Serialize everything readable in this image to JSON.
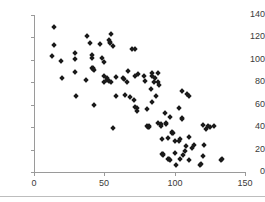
{
  "chart_data": {
    "type": "scatter",
    "title": "",
    "xlabel": "",
    "ylabel": "",
    "xlim": [
      0,
      150
    ],
    "ylim": [
      0,
      140
    ],
    "xticks": [
      0,
      50,
      100,
      150
    ],
    "yticks": [
      0,
      20,
      40,
      60,
      80,
      100,
      120,
      140
    ],
    "grid": false,
    "legend": null,
    "marker": "diamond",
    "marker_color": "#1a1a1a",
    "axis_color": "#9a9a9a",
    "n_points": 110,
    "points": [
      [
        14,
        129
      ],
      [
        13,
        103
      ],
      [
        14,
        113
      ],
      [
        19,
        99
      ],
      [
        20,
        84
      ],
      [
        29,
        106
      ],
      [
        29,
        101
      ],
      [
        29,
        89
      ],
      [
        30,
        68
      ],
      [
        38,
        121
      ],
      [
        37,
        82
      ],
      [
        40,
        115
      ],
      [
        41,
        104
      ],
      [
        41,
        102
      ],
      [
        41,
        93
      ],
      [
        42,
        93
      ],
      [
        42,
        92
      ],
      [
        43,
        91
      ],
      [
        43,
        60
      ],
      [
        47,
        114
      ],
      [
        48,
        102
      ],
      [
        50,
        98
      ],
      [
        50,
        86
      ],
      [
        50,
        80
      ],
      [
        52,
        84
      ],
      [
        52,
        82
      ],
      [
        53,
        81
      ],
      [
        53,
        118
      ],
      [
        54,
        116
      ],
      [
        54,
        115
      ],
      [
        55,
        123
      ],
      [
        55,
        80
      ],
      [
        56,
        112
      ],
      [
        56,
        39
      ],
      [
        58,
        85
      ],
      [
        58,
        68
      ],
      [
        63,
        84
      ],
      [
        64,
        83
      ],
      [
        65,
        69
      ],
      [
        66,
        80
      ],
      [
        67,
        90
      ],
      [
        68,
        67
      ],
      [
        70,
        110
      ],
      [
        72,
        110
      ],
      [
        71,
        64
      ],
      [
        72,
        86
      ],
      [
        72,
        58
      ],
      [
        73,
        57
      ],
      [
        73,
        54
      ],
      [
        74,
        87
      ],
      [
        78,
        86
      ],
      [
        79,
        81
      ],
      [
        80,
        56
      ],
      [
        80,
        41
      ],
      [
        81,
        40
      ],
      [
        82,
        41
      ],
      [
        82,
        40
      ],
      [
        83,
        74
      ],
      [
        84,
        88
      ],
      [
        84,
        86
      ],
      [
        84,
        62
      ],
      [
        85,
        80
      ],
      [
        86,
        84
      ],
      [
        87,
        68
      ],
      [
        88,
        88
      ],
      [
        88,
        80
      ],
      [
        88,
        44
      ],
      [
        89,
        78
      ],
      [
        90,
        43
      ],
      [
        90,
        41
      ],
      [
        91,
        29
      ],
      [
        91,
        16
      ],
      [
        92,
        16
      ],
      [
        92,
        15
      ],
      [
        93,
        53
      ],
      [
        94,
        44
      ],
      [
        94,
        43
      ],
      [
        95,
        30
      ],
      [
        95,
        12
      ],
      [
        96,
        12
      ],
      [
        97,
        11
      ],
      [
        97,
        49
      ],
      [
        98,
        36
      ],
      [
        98,
        35
      ],
      [
        99,
        35
      ],
      [
        100,
        28
      ],
      [
        100,
        17
      ],
      [
        101,
        6
      ],
      [
        103,
        57
      ],
      [
        103,
        28
      ],
      [
        104,
        29
      ],
      [
        104,
        12
      ],
      [
        105,
        48
      ],
      [
        105,
        47
      ],
      [
        105,
        72
      ],
      [
        106,
        15
      ],
      [
        107,
        19
      ],
      [
        108,
        23
      ],
      [
        109,
        70
      ],
      [
        110,
        68
      ],
      [
        110,
        31
      ],
      [
        110,
        11
      ],
      [
        112,
        21
      ],
      [
        114,
        24
      ],
      [
        118,
        6
      ],
      [
        119,
        7
      ],
      [
        120,
        14
      ],
      [
        120,
        42
      ],
      [
        121,
        24
      ],
      [
        122,
        38
      ],
      [
        124,
        41
      ],
      [
        128,
        41
      ],
      [
        133,
        11
      ],
      [
        134,
        12
      ],
      [
        125,
        40
      ]
    ]
  },
  "axes": {
    "y_labels": [
      "140",
      "120",
      "100",
      "80",
      "60",
      "40",
      "20",
      "0"
    ],
    "x_labels": [
      "0",
      "50",
      "100",
      "150"
    ]
  }
}
